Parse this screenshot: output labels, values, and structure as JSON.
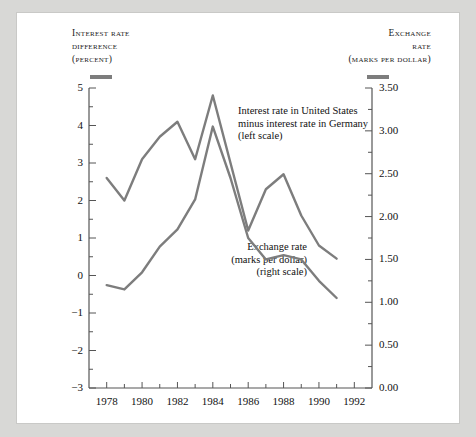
{
  "figure": {
    "left_axis_title_lines": [
      "Interest rate",
      "difference",
      "(percent)"
    ],
    "right_axis_title_lines": [
      "Exchange",
      "rate",
      "(marks per dollar)"
    ],
    "line_color": "#7d7d7d",
    "background": "#ffffff",
    "frame_color": "#d8d8d6"
  },
  "annotations": {
    "interest": [
      "Interest rate in United States",
      "minus interest rate in Germany",
      "(left scale)"
    ],
    "exchange": [
      "Exchange rate",
      "(marks per dollar)",
      "(right scale)"
    ]
  },
  "chart_data": {
    "type": "line",
    "title": "",
    "xlabel": "",
    "ylabel": "Interest rate difference (percent)",
    "y2label": "Exchange rate (marks per dollar)",
    "grid": false,
    "legend": "annotations",
    "xlim": [
      1977,
      1993
    ],
    "ylim": [
      -3,
      5
    ],
    "y2lim": [
      0.0,
      3.5
    ],
    "xticks": [
      1978,
      1980,
      1982,
      1984,
      1986,
      1988,
      1990,
      1992
    ],
    "xticklabels": [
      "1978",
      "1980",
      "1982",
      "1984",
      "1986",
      "1988",
      "1990",
      "1992"
    ],
    "xminorticks": [
      1977,
      1979,
      1981,
      1983,
      1985,
      1987,
      1989,
      1991,
      1993
    ],
    "yticks": [
      -3,
      -2,
      -1,
      0,
      1,
      2,
      3,
      4,
      5
    ],
    "yticklabels": [
      "−3",
      "−2",
      "−1",
      "0",
      "1",
      "2",
      "3",
      "4",
      "5"
    ],
    "yminorticks": [
      -2.5,
      -1.5,
      -0.5,
      0.5,
      1.5,
      2.5,
      3.5,
      4.5
    ],
    "y2ticks": [
      0.0,
      0.5,
      1.0,
      1.5,
      2.0,
      2.5,
      3.0,
      3.5
    ],
    "y2ticklabels": [
      "0.00",
      "0.50",
      "1.00",
      "1.50",
      "2.00",
      "2.50",
      "3.00",
      "3.50"
    ],
    "y2minorticks": [
      0.25,
      0.75,
      1.25,
      1.75,
      2.25,
      2.75,
      3.25
    ],
    "series": [
      {
        "name": "Interest rate in United States minus interest rate in Germany",
        "axis": "left",
        "unit": "percent",
        "x": [
          1978,
          1979,
          1980,
          1981,
          1982,
          1983,
          1984,
          1985,
          1986,
          1987,
          1988,
          1989,
          1990,
          1991
        ],
        "values": [
          2.6,
          2.0,
          3.1,
          3.7,
          4.1,
          3.1,
          4.8,
          3.0,
          1.2,
          2.3,
          2.7,
          1.6,
          0.8,
          0.45
        ]
      },
      {
        "name": "Exchange rate (marks per dollar)",
        "axis": "right",
        "unit": "marks per dollar",
        "x": [
          1978,
          1979,
          1980,
          1981,
          1982,
          1983,
          1984,
          1985,
          1986,
          1987,
          1988,
          1989,
          1990,
          1991
        ],
        "values": [
          1.2,
          1.15,
          1.35,
          1.65,
          1.85,
          2.2,
          3.05,
          2.45,
          1.75,
          1.5,
          1.55,
          1.5,
          1.25,
          1.05
        ]
      }
    ]
  }
}
